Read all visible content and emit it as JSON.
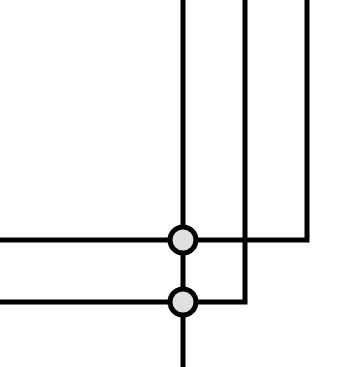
{
  "diagram": {
    "type": "wire-junction",
    "background": "#ffffff",
    "stroke_color": "#000000",
    "stroke_width": 5,
    "node_fill": "#e0e0e0",
    "node_radius": 13,
    "wires": [
      {
        "id": "v1",
        "points": [
          [
            183,
            0
          ],
          [
            183,
            367
          ]
        ]
      },
      {
        "id": "v2-h2",
        "points": [
          [
            245,
            0
          ],
          [
            245,
            302
          ],
          [
            0,
            302
          ]
        ]
      },
      {
        "id": "v3-h1",
        "points": [
          [
            307,
            0
          ],
          [
            307,
            240
          ],
          [
            0,
            240
          ]
        ]
      }
    ],
    "junctions": [
      {
        "id": "j1",
        "cx": 183,
        "cy": 240
      },
      {
        "id": "j2",
        "cx": 183,
        "cy": 302
      }
    ]
  }
}
